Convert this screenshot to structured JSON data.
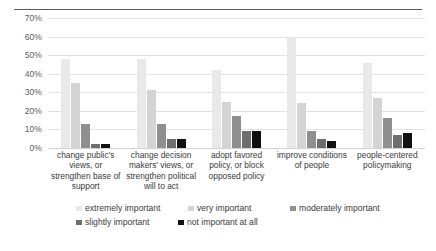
{
  "chart_data": {
    "type": "bar",
    "title": "",
    "subtitle": "",
    "xlabel": "",
    "ylabel": "",
    "ylim": [
      0,
      70
    ],
    "y_tick_step": 10,
    "y_ticks": [
      "0%",
      "10%",
      "20%",
      "30%",
      "40%",
      "50%",
      "60%",
      "70%"
    ],
    "grid": "horizontal",
    "legend_position": "bottom",
    "orientation": "vertical",
    "grouping": "clustered",
    "value_unit": "percent",
    "categories": [
      "change public's views, or strengthen base of support",
      "change decision makers' views, or strengthen political will to act",
      "adopt favored policy, or block opposed policy",
      "improve conditions of people",
      "people-centered policymaking"
    ],
    "series": [
      {
        "name": "extremely important",
        "color": "#e9e9e9",
        "values": [
          48,
          48,
          42,
          60,
          46
        ]
      },
      {
        "name": "very important",
        "color": "#d4d4d4",
        "values": [
          35,
          31,
          25,
          24,
          27
        ]
      },
      {
        "name": "moderately important",
        "color": "#8f8f8f",
        "values": [
          13,
          13,
          17,
          9,
          16
        ]
      },
      {
        "name": "slightly important",
        "color": "#6e6e6e",
        "values": [
          2,
          5,
          9,
          5,
          7
        ]
      },
      {
        "name": "not important at all",
        "color": "#111111",
        "values": [
          2,
          5,
          9,
          4,
          8
        ]
      }
    ]
  },
  "legend": {
    "rows": [
      [
        "extremely important",
        "very important",
        "moderately important"
      ],
      [
        "slightly important",
        "not important at all"
      ]
    ]
  },
  "colors": {
    "series_1": "#e9e9e9",
    "series_2": "#d4d4d4",
    "series_3": "#8f8f8f",
    "series_4": "#6e6e6e",
    "series_5": "#111111",
    "gridline": "#e2e2e2",
    "text": "#3b3b3b",
    "rule": "#5a5a5a"
  }
}
